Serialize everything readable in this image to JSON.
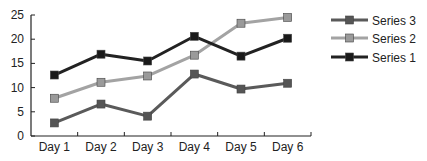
{
  "chart_data": {
    "type": "line",
    "title": "",
    "xlabel": "",
    "ylabel": "",
    "categories": [
      "Day 1",
      "Day 2",
      "Day 3",
      "Day 4",
      "Day 5",
      "Day 6"
    ],
    "ylim": [
      0,
      25
    ],
    "yticks": [
      0,
      5,
      10,
      15,
      20,
      25
    ],
    "grid": false,
    "legend_position": "right",
    "series": [
      {
        "name": "Series 1",
        "values": [
          12.6,
          16.9,
          15.5,
          20.6,
          16.5,
          20.2
        ],
        "color": "#222222",
        "marker_color": "#1a1a1a"
      },
      {
        "name": "Series 2",
        "values": [
          7.8,
          11.1,
          12.4,
          16.7,
          23.3,
          24.5
        ],
        "color": "#a3a3a3",
        "marker_color": "#9a9a9a"
      },
      {
        "name": "Series 3",
        "values": [
          2.7,
          6.6,
          4.1,
          12.8,
          9.7,
          10.9
        ],
        "color": "#5a5a5a",
        "marker_color": "#555555"
      }
    ],
    "legend_order": [
      "Series 3",
      "Series 2",
      "Series 1"
    ]
  }
}
